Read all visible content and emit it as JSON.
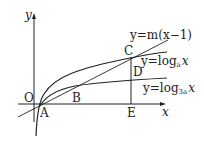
{
  "diagram": {
    "axes": {
      "x_label": "x",
      "y_label": "y",
      "origin_label": "O"
    },
    "points": [
      {
        "name": "A"
      },
      {
        "name": "B"
      },
      {
        "name": "C"
      },
      {
        "name": "D"
      },
      {
        "name": "E"
      }
    ],
    "curves": {
      "line": {
        "label_prefix": "y=m(x−1)"
      },
      "log_a": {
        "label_y": "y=log",
        "base": "a",
        "var": "x"
      },
      "log_3a": {
        "label_y": "y=log",
        "base": "3a",
        "var": "x"
      }
    },
    "colors": {
      "stroke": "#222222",
      "background": "#ffffff"
    }
  }
}
